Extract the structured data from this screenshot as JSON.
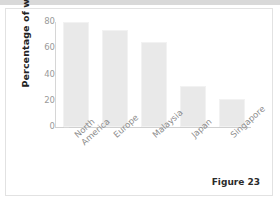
{
  "figure": {
    "caption": "Figure 23"
  },
  "chart_data": {
    "type": "bar",
    "title": "",
    "xlabel": "",
    "ylabel": "Percentage of women",
    "categories": [
      "North\nAmerica",
      "Europe",
      "Malaysia",
      "Japan",
      "Singapore"
    ],
    "values": [
      80,
      74,
      65,
      31,
      21
    ],
    "ylim": [
      0,
      80
    ],
    "yticks": [
      0,
      20,
      40,
      60,
      80
    ],
    "ytick_labels": [
      "0",
      "20",
      "40",
      "60",
      "80"
    ],
    "grid": false,
    "legend": null,
    "bar_color": "#e9e9e9",
    "axis_color": "#d6d6d6",
    "tick_text_color": "#9a9a9a",
    "label_text_color": "#8d8d8d"
  }
}
